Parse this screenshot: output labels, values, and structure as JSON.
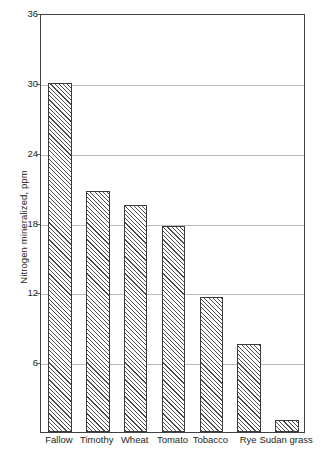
{
  "chart_data": {
    "type": "bar",
    "title": "",
    "xlabel": "",
    "ylabel": "Nitrogen mineralized, ppm",
    "categories": [
      "Fallow",
      "Timothy",
      "Wheat",
      "Tomato",
      "Tobacco",
      "Rye",
      "Sudan grass"
    ],
    "values": [
      30.0,
      20.7,
      19.5,
      17.7,
      11.6,
      7.6,
      1.0
    ],
    "ylim": [
      0,
      36
    ],
    "yticks": [
      6,
      12,
      18,
      24,
      30,
      36
    ],
    "ytick_labels": [
      "6",
      "12",
      "18",
      "24",
      "30",
      "36"
    ],
    "grid": true,
    "grid_axis": "y",
    "legend": false,
    "legend_position": "none",
    "bar_fill": "diagonal-hatch",
    "bar_edge_color": "#3b3a3c",
    "grid_color": "#b9bbbd",
    "axis_color": "#414042",
    "text_color": "#231f20"
  }
}
